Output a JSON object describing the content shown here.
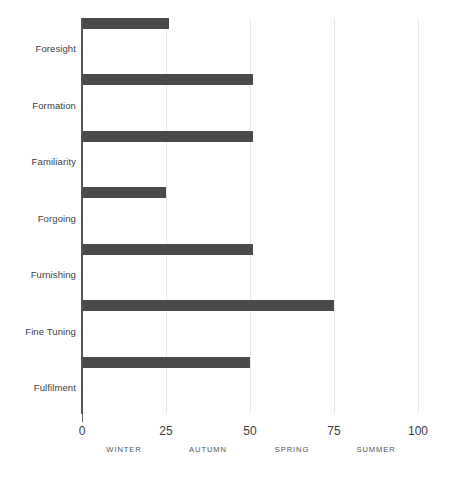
{
  "chart_data": {
    "type": "bar",
    "orientation": "horizontal",
    "title": "",
    "xlabel": "",
    "ylabel": "",
    "xlim": [
      0,
      100
    ],
    "grid": true,
    "legend": "none",
    "bar_color": "#4a4a4a",
    "gridline_color": "#e9e9e9",
    "axis_color": "#555555",
    "categories": [
      "Foresight",
      "Formation",
      "Familiarity",
      "Forgoing",
      "Furnishing",
      "Fine Tuning",
      "Fulfilment"
    ],
    "values": [
      26,
      51,
      51,
      25,
      51,
      75,
      50
    ],
    "xticks": [
      0,
      25,
      50,
      75,
      100
    ],
    "xtick_labels": [
      "0",
      "25",
      "50",
      "75",
      "100"
    ],
    "secondary_xlabels": [
      {
        "label": "WINTER",
        "at": 12.5
      },
      {
        "label": "AUTUMN",
        "at": 37.5
      },
      {
        "label": "SPRING",
        "at": 62.5
      },
      {
        "label": "SUMMER",
        "at": 87.5
      }
    ]
  }
}
